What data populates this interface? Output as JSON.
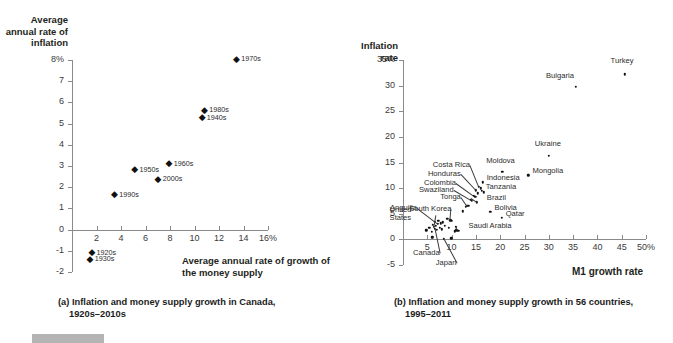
{
  "figure": {
    "panels": [
      {
        "id": "a",
        "caption_line1": "(a) Inflation and money supply growth in Canada,",
        "caption_line2": "1920s–2010s"
      },
      {
        "id": "b",
        "caption_line1": "(b) Inflation and money supply growth in 56 countries,",
        "caption_line2": "1995–2011"
      }
    ]
  },
  "chart_data": [
    {
      "type": "scatter",
      "title": "(a) Inflation and money supply growth in Canada, 1920s–2010s",
      "ylabel": "Average annual rate of inflation",
      "xlabel": "Average annual rate of growth of the money supply",
      "xlim": [
        0,
        16
      ],
      "ylim": [
        -2,
        8
      ],
      "xticks": [
        "2",
        "4",
        "6",
        "8",
        "10",
        "12",
        "14",
        "16%"
      ],
      "xtick_values": [
        2,
        4,
        6,
        8,
        10,
        12,
        14,
        16
      ],
      "yticks": [
        "8%",
        "7",
        "6",
        "5",
        "4",
        "3",
        "2",
        "1",
        "0",
        "-1",
        "-2"
      ],
      "ytick_values": [
        8,
        7,
        6,
        5,
        4,
        3,
        2,
        1,
        0,
        -1,
        -2
      ],
      "grid": false,
      "legend": "none",
      "points": [
        {
          "label": "1970s",
          "x": 13.4,
          "y": 8.05
        },
        {
          "label": "1980s",
          "x": 10.8,
          "y": 5.65
        },
        {
          "label": "1940s",
          "x": 10.6,
          "y": 5.3
        },
        {
          "label": "1960s",
          "x": 7.9,
          "y": 3.12
        },
        {
          "label": "1950s",
          "x": 5.1,
          "y": 2.85
        },
        {
          "label": "2000s",
          "x": 7.0,
          "y": 2.4
        },
        {
          "label": "1990s",
          "x": 3.45,
          "y": 1.65
        },
        {
          "label": "1920s",
          "x": 1.6,
          "y": -1.08
        },
        {
          "label": "1930s",
          "x": 1.45,
          "y": -1.38
        }
      ]
    },
    {
      "type": "scatter",
      "title": "(b) Inflation and money supply growth in 56 countries, 1995–2011",
      "ylabel": "Inflation rate",
      "xlabel": "M1 growth rate",
      "xlim": [
        0,
        50
      ],
      "ylim": [
        -5,
        35
      ],
      "xticks": [
        "5",
        "10",
        "15",
        "20",
        "25",
        "30",
        "35",
        "40",
        "45",
        "50%"
      ],
      "xtick_values": [
        5,
        10,
        15,
        20,
        25,
        30,
        35,
        40,
        45,
        50
      ],
      "yticks": [
        "35%",
        "30",
        "25",
        "20",
        "15",
        "10",
        "5",
        "0",
        "-5"
      ],
      "ytick_values": [
        35,
        30,
        25,
        20,
        15,
        10,
        5,
        0,
        -5
      ],
      "grid": false,
      "legend": "none",
      "labeled_points": [
        {
          "label": "Turkey",
          "x": 45.6,
          "y": 32.2
        },
        {
          "label": "Bulgaria",
          "x": 35.6,
          "y": 29.8
        },
        {
          "label": "Ukraine",
          "x": 30.0,
          "y": 16.3
        },
        {
          "label": "Moldova",
          "x": 20.4,
          "y": 13.2
        },
        {
          "label": "Mongolia",
          "x": 25.8,
          "y": 12.5
        },
        {
          "label": "Costa Rica",
          "x": 15.6,
          "y": 10.3
        },
        {
          "label": "Indonesia",
          "x": 16.4,
          "y": 11.1
        },
        {
          "label": "Honduras",
          "x": 15.0,
          "y": 9.6
        },
        {
          "label": "Tanzania",
          "x": 16.2,
          "y": 9.5
        },
        {
          "label": "Colombia",
          "x": 14.6,
          "y": 8.5
        },
        {
          "label": "Swaziland",
          "x": 14.0,
          "y": 7.7
        },
        {
          "label": "Brazil",
          "x": 15.2,
          "y": 7.2
        },
        {
          "label": "Tonga",
          "x": 13.2,
          "y": 6.5
        },
        {
          "label": "Bolivia",
          "x": 18.0,
          "y": 5.4
        },
        {
          "label": "Qatar",
          "x": 20.3,
          "y": 4.2
        },
        {
          "label": "South Korea",
          "x": 9.7,
          "y": 3.7
        },
        {
          "label": "Anguilla",
          "x": 7.2,
          "y": 3.0
        },
        {
          "label": "Saudi Arabia",
          "x": 11.0,
          "y": 1.8
        },
        {
          "label": "United States",
          "x": 6.3,
          "y": 2.4
        },
        {
          "label": "Canada",
          "x": 6.6,
          "y": 2.1
        },
        {
          "label": "Japan",
          "x": 8.4,
          "y": 0.1
        }
      ],
      "unlabeled_points": [
        {
          "x": 4.8,
          "y": 1.8
        },
        {
          "x": 5.4,
          "y": 2.2
        },
        {
          "x": 5.9,
          "y": 1.5
        },
        {
          "x": 6.1,
          "y": 2.9
        },
        {
          "x": 6.5,
          "y": 3.4
        },
        {
          "x": 6.8,
          "y": 2.6
        },
        {
          "x": 7.0,
          "y": 1.9
        },
        {
          "x": 7.3,
          "y": 3.6
        },
        {
          "x": 7.6,
          "y": 2.3
        },
        {
          "x": 7.8,
          "y": 3.1
        },
        {
          "x": 8.0,
          "y": 2.0
        },
        {
          "x": 8.2,
          "y": 3.3
        },
        {
          "x": 8.6,
          "y": 2.7
        },
        {
          "x": 9.1,
          "y": 4.0
        },
        {
          "x": 9.4,
          "y": 2.2
        },
        {
          "x": 10.1,
          "y": 3.6
        },
        {
          "x": 10.6,
          "y": 1.6
        },
        {
          "x": 10.9,
          "y": 2.4
        },
        {
          "x": 11.4,
          "y": 1.7
        },
        {
          "x": 12.3,
          "y": 5.5
        },
        {
          "x": 12.9,
          "y": 6.4
        },
        {
          "x": 13.6,
          "y": 6.6
        },
        {
          "x": 14.2,
          "y": 7.5
        },
        {
          "x": 14.9,
          "y": 8.3
        },
        {
          "x": 15.4,
          "y": 9.0
        },
        {
          "x": 16.0,
          "y": 10.0
        },
        {
          "x": 16.6,
          "y": 9.2
        },
        {
          "x": 6.0,
          "y": 0.4
        },
        {
          "x": 9.9,
          "y": 0.2
        }
      ]
    }
  ]
}
